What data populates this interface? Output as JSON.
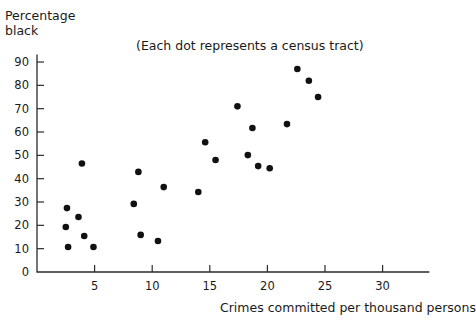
{
  "chart_data": {
    "type": "scatter",
    "title": "",
    "annotation": "(Each dot represents a census tract)",
    "xlabel": "Crimes committed per thousand persons",
    "ylabel": "Percentage\nblack",
    "ylabel_line1": "Percentage",
    "ylabel_line2": "black",
    "xlim": [
      0,
      34
    ],
    "ylim": [
      0,
      95
    ],
    "grid": false,
    "legend": "none",
    "xticks": [
      0,
      5,
      10,
      15,
      20,
      25,
      30
    ],
    "xtick_labels": [
      "",
      "5",
      "10",
      "15",
      "20",
      "25",
      "30"
    ],
    "yticks": [
      0,
      10,
      20,
      30,
      40,
      50,
      60,
      70,
      80,
      90
    ],
    "ytick_labels": [
      "0",
      "10",
      "20",
      "30",
      "40",
      "50",
      "60",
      "70",
      "80",
      "90"
    ],
    "point_color": "#111111",
    "axis_color": "#2b2b2b",
    "n_points": 24,
    "x": [
      2.6,
      2.5,
      2.7,
      3.6,
      3.9,
      4.1,
      4.9,
      8.4,
      8.8,
      9.0,
      10.5,
      11.0,
      14.0,
      14.6,
      17.4,
      18.3,
      18.7,
      19.2,
      21.7,
      22.6,
      23.6,
      24.4,
      15.5,
      20.2
    ],
    "y": [
      27.4,
      19.3,
      10.7,
      23.6,
      46.5,
      15.4,
      10.7,
      29.2,
      42.9,
      15.9,
      13.3,
      36.4,
      34.3,
      55.6,
      71.0,
      50.1,
      61.7,
      45.4,
      63.4,
      87.0,
      82.0,
      75.0,
      48.0,
      44.5
    ],
    "points": [
      {
        "x": 2.6,
        "y": 27.4
      },
      {
        "x": 2.5,
        "y": 19.3
      },
      {
        "x": 2.7,
        "y": 10.7
      },
      {
        "x": 3.6,
        "y": 23.6
      },
      {
        "x": 3.9,
        "y": 46.5
      },
      {
        "x": 4.1,
        "y": 15.4
      },
      {
        "x": 4.9,
        "y": 10.7
      },
      {
        "x": 8.4,
        "y": 29.2
      },
      {
        "x": 8.8,
        "y": 42.9
      },
      {
        "x": 9.0,
        "y": 15.9
      },
      {
        "x": 10.5,
        "y": 13.3
      },
      {
        "x": 11.0,
        "y": 36.4
      },
      {
        "x": 14.0,
        "y": 34.3
      },
      {
        "x": 14.6,
        "y": 55.6
      },
      {
        "x": 15.5,
        "y": 48.0
      },
      {
        "x": 17.4,
        "y": 71.0
      },
      {
        "x": 18.3,
        "y": 50.1
      },
      {
        "x": 18.7,
        "y": 61.7
      },
      {
        "x": 19.2,
        "y": 45.4
      },
      {
        "x": 20.2,
        "y": 44.5
      },
      {
        "x": 21.7,
        "y": 63.4
      },
      {
        "x": 22.6,
        "y": 87.0
      },
      {
        "x": 23.6,
        "y": 82.0
      },
      {
        "x": 24.4,
        "y": 75.0
      }
    ]
  }
}
